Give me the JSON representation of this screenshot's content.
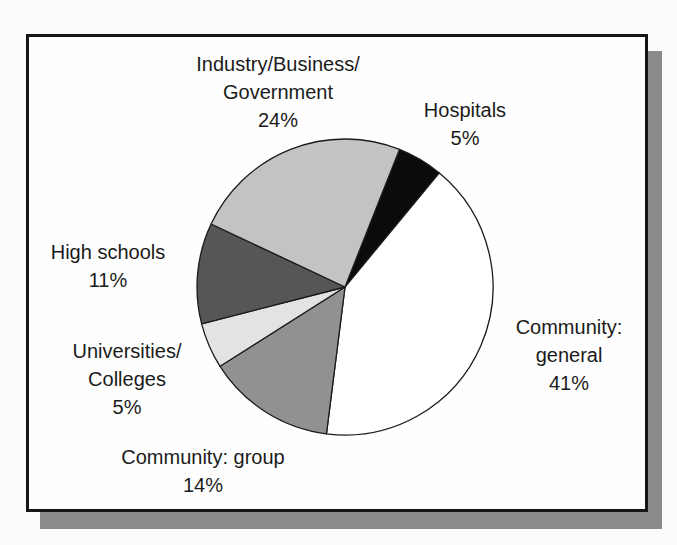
{
  "chart_data": {
    "type": "pie",
    "title": "",
    "direction": "clockwise",
    "start_angle_deg": 21.6,
    "stroke_color": "#1b1b1b",
    "slices": [
      {
        "id": "hospitals",
        "label": "Hospitals",
        "value": 5,
        "color": "#0b0b0b"
      },
      {
        "id": "community-general",
        "label": "Community: general",
        "value": 41,
        "color": "#ffffff"
      },
      {
        "id": "community-group",
        "label": "Community: group",
        "value": 14,
        "color": "#919191"
      },
      {
        "id": "universities-colleges",
        "label": "Universities/Colleges",
        "value": 5,
        "color": "#e3e3e3"
      },
      {
        "id": "high-schools",
        "label": "High schools",
        "value": 11,
        "color": "#565656"
      },
      {
        "id": "industry-business-government",
        "label": "Industry/Business/Government",
        "value": 24,
        "color": "#c3c3c3"
      }
    ],
    "labels": [
      {
        "id": "industry-business-government",
        "lines": [
          "Industry/Business/",
          "Government",
          "24%"
        ]
      },
      {
        "id": "hospitals",
        "lines": [
          "Hospitals",
          "5%"
        ]
      },
      {
        "id": "community-general",
        "lines": [
          "Community:",
          "general",
          "41%"
        ]
      },
      {
        "id": "high-schools",
        "lines": [
          "High schools",
          "11%"
        ]
      },
      {
        "id": "universities-colleges",
        "lines": [
          "Universities/",
          "Colleges",
          "5%"
        ]
      },
      {
        "id": "community-group",
        "lines": [
          "Community: group",
          "14%"
        ]
      }
    ]
  }
}
